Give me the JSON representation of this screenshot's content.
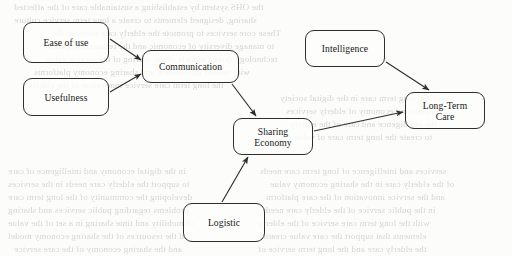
{
  "figure": {
    "kind": "flowchart-diagram",
    "background_color": "#fcfcfa",
    "line_color": "#2e2e2e",
    "text_color": "#171717"
  },
  "nodes": [
    {
      "id": "ease-of-use",
      "label": "Ease of use",
      "x": 23,
      "y": 22,
      "w": 86,
      "h": 41
    },
    {
      "id": "usefulness",
      "label": "Usefulness",
      "x": 23,
      "y": 78,
      "w": 86,
      "h": 38
    },
    {
      "id": "communication",
      "label": "Communication",
      "x": 142,
      "y": 50,
      "w": 97,
      "h": 33
    },
    {
      "id": "intelligence",
      "label": "Intelligence",
      "x": 305,
      "y": 30,
      "w": 80,
      "h": 37
    },
    {
      "id": "sharing-economy",
      "label": "Sharing\nEconomy",
      "x": 233,
      "y": 118,
      "w": 80,
      "h": 37
    },
    {
      "id": "long-term-care",
      "label": "Long-Term\nCare",
      "x": 405,
      "y": 92,
      "w": 80,
      "h": 37
    },
    {
      "id": "logistic",
      "label": "Logistic",
      "x": 183,
      "y": 203,
      "w": 82,
      "h": 39
    }
  ],
  "edges": [
    {
      "id": "ease-to-communication",
      "from": "ease-of-use",
      "to": "communication",
      "points": "110,39 141,60",
      "arrow_at": "141,60"
    },
    {
      "id": "usefulness-to-communication",
      "from": "usefulness",
      "to": "communication",
      "points": "110,92 141,74",
      "arrow_at": "141,74"
    },
    {
      "id": "communication-to-sharing",
      "from": "communication",
      "to": "sharing-economy",
      "points": "232,84 256,116",
      "arrow_at": "256,116"
    },
    {
      "id": "intelligence-to-care",
      "from": "intelligence",
      "to": "long-term-care",
      "points": "386,62 429,90",
      "arrow_at": "429,90"
    },
    {
      "id": "sharing-to-care",
      "from": "sharing-economy",
      "to": "long-term-care",
      "points": "314,131 403,112",
      "arrow_at": "403,112"
    },
    {
      "id": "logistic-to-sharing",
      "from": "logistic",
      "to": "sharing-economy",
      "points": "222,202 248,157",
      "arrow_at": "248,157"
    }
  ],
  "bleed_text": {
    "note": "faint mirrored show-through of text printed on the reverse of the scanned page; illegible",
    "lines": [
      {
        "text": "the OHS system by establishing a sustainable care of the affected",
        "x": 14,
        "y": 2
      },
      {
        "text": "sharing, designed elements to create a long term service culture",
        "x": 14,
        "y": 15
      },
      {
        "text": "These core services to promote the elderly care needs of the",
        "x": 52,
        "y": 28
      },
      {
        "text": "to manage diversity of economic and the resources required",
        "x": 46,
        "y": 41
      },
      {
        "text": "technology driven models of the sharing of the service value",
        "x": 46,
        "y": 54
      },
      {
        "text": "with related information and sharing economy platforms",
        "x": 34,
        "y": 67
      },
      {
        "text": "the long term care service innovation of the elderly",
        "x": 28,
        "y": 80
      },
      {
        "text": "in the digital economy and intelligence of care",
        "x": 8,
        "y": 166
      },
      {
        "text": "to support the elderly care needs in the services",
        "x": 8,
        "y": 179
      },
      {
        "text": "developing the community of the long term care",
        "x": 8,
        "y": 192
      },
      {
        "text": "problems regarding public services and sharing",
        "x": 8,
        "y": 205
      },
      {
        "text": "of mobility and time sharing in a set of the value",
        "x": 8,
        "y": 218
      },
      {
        "text": "and the resources of the sharing economy model",
        "x": 8,
        "y": 231
      },
      {
        "text": "services and intelligence of long term care needs",
        "x": 260,
        "y": 166
      },
      {
        "text": "of the elderly care in the sharing economy value",
        "x": 270,
        "y": 179
      },
      {
        "text": "and the service innovation of the care platform",
        "x": 266,
        "y": 192
      },
      {
        "text": "in the public service of the elderly care needs",
        "x": 262,
        "y": 205
      },
      {
        "text": "with the long term care service of the elderly",
        "x": 258,
        "y": 218
      },
      {
        "text": "elements that support the care value creation",
        "x": 256,
        "y": 231
      },
      {
        "text": "the elderly care and the long term service of",
        "x": 258,
        "y": 244
      },
      {
        "text": "and the sharing economy of the care service",
        "x": 14,
        "y": 244
      },
      {
        "text": "of the long term care in the digital society",
        "x": 280,
        "y": 93
      },
      {
        "text": "and sharing economy of elderly services",
        "x": 286,
        "y": 106
      },
      {
        "text": "the intelligence and care of the elderly",
        "x": 290,
        "y": 119
      },
      {
        "text": "to create the long term care of value",
        "x": 294,
        "y": 132
      }
    ]
  }
}
